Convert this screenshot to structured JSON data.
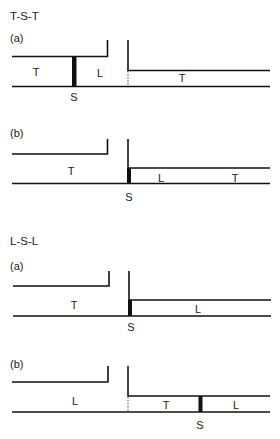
{
  "figure": {
    "sections": [
      {
        "title": "T-S-T",
        "panels": [
          {
            "label": "(a)",
            "left_region": "T",
            "middle_region": "L",
            "right_region": "T",
            "separator": "S",
            "separator_position": "left-channel",
            "junction": "dashed"
          },
          {
            "label": "(b)",
            "left_region": "T",
            "right_regions": [
              "L",
              "T"
            ],
            "separator": "S",
            "separator_position": "junction",
            "junction": "solid"
          }
        ]
      },
      {
        "title": "L-S-L",
        "panels": [
          {
            "label": "(a)",
            "left_region": "T",
            "right_region": "L",
            "separator": "S",
            "separator_position": "junction",
            "junction": "solid"
          },
          {
            "label": "(b)",
            "left_region": "L",
            "right_regions": [
              "T",
              "L"
            ],
            "separator": "S",
            "separator_position": "right-channel",
            "junction": "dashed"
          }
        ]
      }
    ]
  },
  "colors": {
    "line": "#111111",
    "background": "#ffffff"
  }
}
